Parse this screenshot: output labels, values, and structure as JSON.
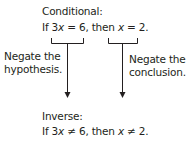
{
  "conditional": {
    "label": "Conditional:",
    "statement": {
      "if": "If 3",
      "var1": "x",
      "mid1": " = 6, then ",
      "var2": "x",
      "end": " = 2."
    }
  },
  "left_branch": {
    "label_line1": "Negate the",
    "label_line2": "hypothesis."
  },
  "right_branch": {
    "label_line1": "Negate the",
    "label_line2": "conclusion."
  },
  "inverse": {
    "label": "Inverse:",
    "statement": {
      "if": "If 3",
      "var1": "x",
      "mid1": " ≠ 6, then ",
      "var2": "x",
      "end": " ≠ 2."
    }
  },
  "colors": {
    "text": "#231f20",
    "lines": "#231f20",
    "background": "#ffffff"
  }
}
